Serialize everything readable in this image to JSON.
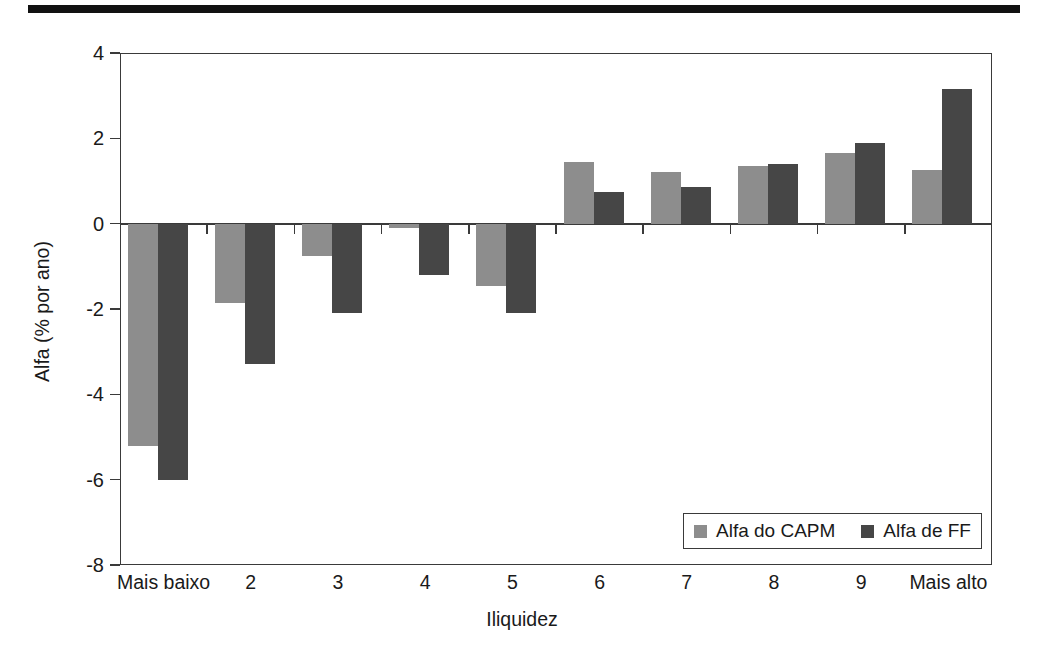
{
  "figure": {
    "top_rule": "horizontal-rule",
    "y_axis_title": "Alfa (% por ano)",
    "x_axis_title": "Iliquidez"
  },
  "legend": {
    "position": "bottom-right-inside",
    "entries": [
      {
        "label": "Alfa do CAPM",
        "color": "#8d8d8d"
      },
      {
        "label": "Alfa de FF",
        "color": "#464646"
      }
    ]
  },
  "chart_data": {
    "type": "bar",
    "title": "",
    "subtitle": "",
    "xlabel": "Iliquidez",
    "ylabel": "Alfa (% por ano)",
    "ylim": [
      -8,
      4
    ],
    "yticks": [
      4,
      2,
      0,
      -2,
      -4,
      -6,
      -8
    ],
    "ytick_labels": [
      "4",
      "2",
      "0",
      "-2",
      "-4",
      "-6",
      "-8"
    ],
    "grid": false,
    "zero_line": true,
    "legend_position": "lower right",
    "categories": [
      "Mais baixo",
      "2",
      "3",
      "4",
      "5",
      "6",
      "7",
      "8",
      "9",
      "Mais alto"
    ],
    "series": [
      {
        "name": "Alfa do CAPM",
        "color": "#8d8d8d",
        "values": [
          -5.2,
          -1.85,
          -0.75,
          -0.1,
          -1.45,
          1.45,
          1.2,
          1.35,
          1.65,
          1.25
        ]
      },
      {
        "name": "Alfa de FF",
        "color": "#464646",
        "values": [
          -6.0,
          -3.3,
          -2.1,
          -1.2,
          -2.1,
          0.75,
          0.85,
          1.4,
          1.9,
          3.15
        ]
      }
    ]
  }
}
